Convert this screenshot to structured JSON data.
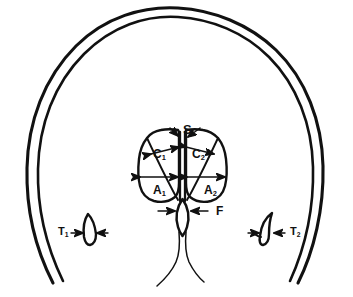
{
  "figure": {
    "stroke_color": "#111111",
    "background_color": "#ffffff",
    "labels": [
      {
        "id": "S",
        "text": "S",
        "sub": "",
        "x": 183,
        "y": 123,
        "kind": "septum"
      },
      {
        "id": "C1",
        "text": "C",
        "sub": "1",
        "x": 153,
        "y": 148,
        "kind": "caudate"
      },
      {
        "id": "C2",
        "text": "C",
        "sub": "2",
        "x": 192,
        "y": 148,
        "kind": "caudate"
      },
      {
        "id": "A1",
        "text": "A",
        "sub": "1",
        "x": 153,
        "y": 184,
        "kind": "anterior-horn"
      },
      {
        "id": "A2",
        "text": "A",
        "sub": "2",
        "x": 204,
        "y": 184,
        "kind": "anterior-horn"
      },
      {
        "id": "F",
        "text": "F",
        "sub": "",
        "x": 216,
        "y": 208,
        "kind": "third-ventricle"
      },
      {
        "id": "T1",
        "text": "T",
        "sub": "1",
        "x": 58,
        "y": 226,
        "kind": "temporal-horn"
      },
      {
        "id": "T2",
        "text": "T",
        "sub": "2",
        "x": 290,
        "y": 226,
        "kind": "temporal-horn"
      }
    ]
  }
}
